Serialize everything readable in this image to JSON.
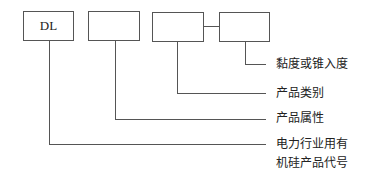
{
  "diagram": {
    "boxes": [
      {
        "id": "box-1",
        "text": "DL"
      },
      {
        "id": "box-2",
        "text": ""
      },
      {
        "id": "box-3",
        "text": ""
      },
      {
        "id": "box-4",
        "text": ""
      }
    ],
    "labels": {
      "box4": "黏度或锥入度",
      "box3": "产品类别",
      "box2": "产品属性",
      "box1_line1": "电力行业用有",
      "box1_line2": "机硅产品代号"
    },
    "line_color": "#555555"
  }
}
